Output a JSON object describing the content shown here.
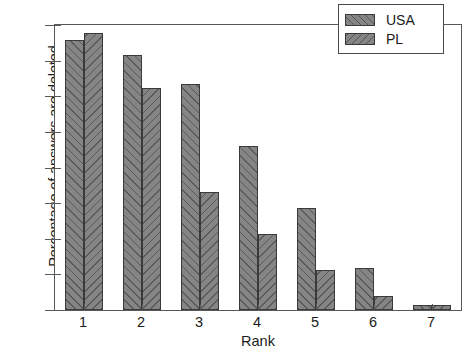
{
  "chart_data": {
    "type": "bar",
    "title": "",
    "subtitle": "",
    "xlabel": "Rank",
    "ylabel": "Percentage of answers are deleted",
    "categories": [
      "1",
      "2",
      "3",
      "4",
      "5",
      "6",
      "7"
    ],
    "series": [
      {
        "name": "USA",
        "values": [
          0.757,
          0.715,
          0.635,
          0.461,
          0.285,
          0.117,
          0.013
        ],
        "hatch": "/",
        "color": "#858585"
      },
      {
        "name": "PL",
        "values": [
          0.777,
          0.622,
          0.331,
          0.212,
          0.113,
          0.039,
          0.014
        ],
        "hatch": "\\",
        "color": "#858585"
      }
    ],
    "ylim": [
      0.0,
      0.8
    ],
    "xlim": [
      0.5,
      7.5
    ],
    "ytick_labels": [
      "0.0",
      "0.1",
      "0.2",
      "0.3",
      "0.4",
      "0.5",
      "0.6",
      "0.7",
      "0.8"
    ],
    "ytick_values": [
      0.0,
      0.1,
      0.2,
      0.3,
      0.4,
      0.5,
      0.6,
      0.7,
      0.8
    ],
    "xtick_labels": [
      "1",
      "2",
      "3",
      "4",
      "5",
      "6",
      "7"
    ],
    "grid": false,
    "legend_position": "upper right",
    "legend_entries": [
      "USA",
      "PL"
    ]
  }
}
